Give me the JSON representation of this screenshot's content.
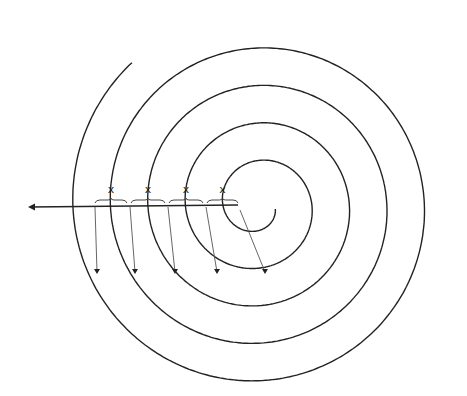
{
  "diagram": {
    "spacing_labels": [
      "x",
      "x",
      "x",
      "x"
    ],
    "turns": 4.6,
    "colors": {
      "stroke": "#222222",
      "arrow": "#333333",
      "background": "#ffffff"
    }
  }
}
